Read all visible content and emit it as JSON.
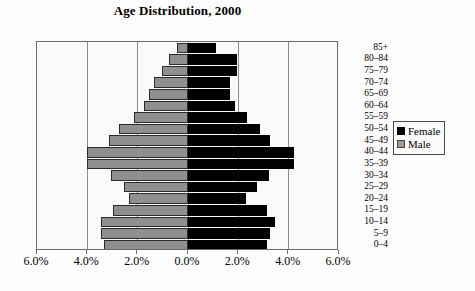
{
  "chart_data": {
    "type": "bar",
    "title": "Age Distribution, 2000",
    "xlabel": "",
    "ylabel": "",
    "orientation": "horizontal",
    "style": "population-pyramid",
    "grid": true,
    "legend_position": "right",
    "xlim": [
      -6.0,
      6.0
    ],
    "xticks": [
      "6.0%",
      "4.0%",
      "2.0%",
      "0.0%",
      "2.0%",
      "4.0%",
      "6.0%"
    ],
    "xtick_values": [
      -6.0,
      -4.0,
      -2.0,
      0.0,
      2.0,
      4.0,
      6.0
    ],
    "categories": [
      "85+",
      "80–84",
      "75–79",
      "70–74",
      "65–69",
      "60–64",
      "55–59",
      "50–54",
      "45–49",
      "40–44",
      "35–39",
      "30–34",
      "25–29",
      "20–24",
      "15–19",
      "10–14",
      "5–9",
      "0–4"
    ],
    "series": [
      {
        "name": "Male",
        "color": "#8f8f8f",
        "values": [
          0.45,
          0.75,
          1.05,
          1.35,
          1.55,
          1.75,
          2.15,
          2.75,
          3.15,
          4.0,
          4.0,
          3.05,
          2.55,
          2.35,
          3.0,
          3.45,
          3.45,
          3.35
        ]
      },
      {
        "name": "Female",
        "color": "#000000",
        "values": [
          1.1,
          1.95,
          1.95,
          1.65,
          1.65,
          1.85,
          2.35,
          2.85,
          3.25,
          4.2,
          4.2,
          3.2,
          2.75,
          2.3,
          3.15,
          3.45,
          3.25,
          3.15
        ]
      }
    ]
  },
  "legend": {
    "items": [
      {
        "label": "Female",
        "color": "#000000"
      },
      {
        "label": "Male",
        "color": "#9a9a9a"
      }
    ]
  }
}
